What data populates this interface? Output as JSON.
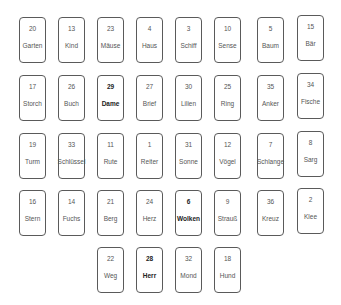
{
  "layout": {
    "col_x": [
      19,
      58,
      97,
      136,
      175,
      214,
      257,
      297
    ],
    "row_y": [
      17,
      75,
      133,
      190,
      247
    ],
    "last_row_x": [
      97,
      136,
      175,
      214
    ]
  },
  "rows": [
    [
      {
        "number": "20",
        "name": "Garten",
        "bold": false
      },
      {
        "number": "13",
        "name": "Kind",
        "bold": false
      },
      {
        "number": "23",
        "name": "Mäuse",
        "bold": false
      },
      {
        "number": "4",
        "name": "Haus",
        "bold": false
      },
      {
        "number": "3",
        "name": "Schiff",
        "bold": false
      },
      {
        "number": "10",
        "name": "Sense",
        "bold": false
      },
      {
        "number": "5",
        "name": "Baum",
        "bold": false
      },
      {
        "number": "15",
        "name": "Bär",
        "bold": false
      }
    ],
    [
      {
        "number": "17",
        "name": "Storch",
        "bold": false
      },
      {
        "number": "26",
        "name": "Buch",
        "bold": false
      },
      {
        "number": "29",
        "name": "Dame",
        "bold": true
      },
      {
        "number": "27",
        "name": "Brief",
        "bold": false
      },
      {
        "number": "30",
        "name": "Lilien",
        "bold": false
      },
      {
        "number": "25",
        "name": "Ring",
        "bold": false
      },
      {
        "number": "35",
        "name": "Anker",
        "bold": false
      },
      {
        "number": "34",
        "name": "Fische",
        "bold": false
      }
    ],
    [
      {
        "number": "19",
        "name": "Turm",
        "bold": false
      },
      {
        "number": "33",
        "name": "Schlüssel",
        "bold": false
      },
      {
        "number": "11",
        "name": "Rute",
        "bold": false
      },
      {
        "number": "1",
        "name": "Reiter",
        "bold": false
      },
      {
        "number": "31",
        "name": "Sonne",
        "bold": false
      },
      {
        "number": "12",
        "name": "Vögel",
        "bold": false
      },
      {
        "number": "7",
        "name": "Schlange",
        "bold": false
      },
      {
        "number": "8",
        "name": "Sarg",
        "bold": false
      }
    ],
    [
      {
        "number": "16",
        "name": "Stern",
        "bold": false
      },
      {
        "number": "14",
        "name": "Fuchs",
        "bold": false
      },
      {
        "number": "21",
        "name": "Berg",
        "bold": false
      },
      {
        "number": "24",
        "name": "Herz",
        "bold": false
      },
      {
        "number": "6",
        "name": "Wolken",
        "bold": true
      },
      {
        "number": "9",
        "name": "Strauß",
        "bold": false
      },
      {
        "number": "36",
        "name": "Kreuz",
        "bold": false
      },
      {
        "number": "2",
        "name": "Klee",
        "bold": false
      }
    ],
    [
      {
        "number": "22",
        "name": "Weg",
        "bold": false
      },
      {
        "number": "28",
        "name": "Herr",
        "bold": true
      },
      {
        "number": "32",
        "name": "Mond",
        "bold": false
      },
      {
        "number": "18",
        "name": "Hund",
        "bold": false
      }
    ]
  ]
}
